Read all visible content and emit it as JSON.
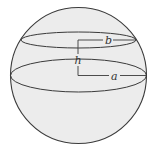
{
  "diagram": {
    "type": "sphere-zone",
    "colors": {
      "fill": "#ececec",
      "stroke": "#3a3a3a",
      "background": "#ffffff",
      "label": "#333333"
    },
    "sphere": {
      "cx": 78.5,
      "cy": 75.5,
      "r": 68
    },
    "circles": [
      {
        "name": "upper-circle",
        "cx": 78.5,
        "cy": 40,
        "rx": 57.5,
        "ry": 8
      },
      {
        "name": "equator",
        "cx": 78.5,
        "cy": 75.5,
        "rx": 68,
        "ry": 16.5
      }
    ],
    "labels": {
      "b": "b",
      "h": "h",
      "a": "a"
    },
    "label_positions": {
      "b": {
        "x": 106,
        "y": 44
      },
      "h": {
        "x": 76,
        "y": 63
      },
      "a": {
        "x": 112,
        "y": 79
      }
    }
  }
}
